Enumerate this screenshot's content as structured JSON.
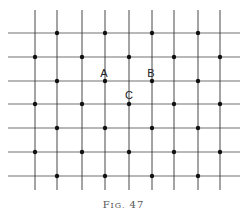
{
  "figure": {
    "caption_prefix": "F",
    "caption_smallcaps": "IG.",
    "caption_number": "47",
    "caption": "Fig. 47",
    "line_color": "#333333",
    "dot_color": "#111111",
    "vertical_lines_x": [
      35,
      57,
      82,
      105,
      129,
      152,
      174,
      198,
      220
    ],
    "horizontal_lines_y": [
      33,
      57,
      81,
      104,
      128,
      152,
      176
    ],
    "vertical_extent": [
      10,
      190
    ],
    "horizontal_extent": [
      8,
      240
    ],
    "dots": [
      [
        1,
        0
      ],
      [
        3,
        0
      ],
      [
        5,
        0
      ],
      [
        7,
        0
      ],
      [
        0,
        1
      ],
      [
        2,
        1
      ],
      [
        4,
        1
      ],
      [
        6,
        1
      ],
      [
        8,
        1
      ],
      [
        1,
        2
      ],
      [
        3,
        2
      ],
      [
        5,
        2
      ],
      [
        7,
        2
      ],
      [
        0,
        3
      ],
      [
        2,
        3
      ],
      [
        4,
        3
      ],
      [
        6,
        3
      ],
      [
        8,
        3
      ],
      [
        1,
        4
      ],
      [
        3,
        4
      ],
      [
        5,
        4
      ],
      [
        7,
        4
      ],
      [
        0,
        5
      ],
      [
        2,
        5
      ],
      [
        4,
        5
      ],
      [
        6,
        5
      ],
      [
        8,
        5
      ],
      [
        1,
        6
      ],
      [
        3,
        6
      ],
      [
        5,
        6
      ],
      [
        7,
        6
      ]
    ],
    "labels": [
      {
        "text": "A",
        "col": 3,
        "row": 2,
        "x": 104,
        "y": 77
      },
      {
        "text": "B",
        "col": 5,
        "row": 2,
        "x": 151,
        "y": 77
      },
      {
        "text": "C",
        "col": 4,
        "row": 3,
        "x": 129,
        "y": 99
      }
    ]
  }
}
